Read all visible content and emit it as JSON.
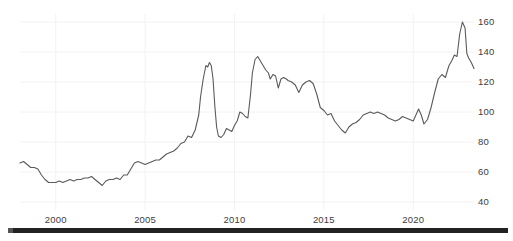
{
  "chart_data": {
    "type": "line",
    "title": "",
    "subtitle": "",
    "xlabel": "",
    "ylabel": "",
    "xlim": [
      1998.0,
      2023.4
    ],
    "ylim": [
      35,
      165
    ],
    "grid": true,
    "grid_color": "#f2f2f2",
    "legend": "none",
    "line_color": "#5a5a5a",
    "line_width": 1.1,
    "background": "#ffffff",
    "yticks": [
      40,
      60,
      80,
      100,
      120,
      140,
      160
    ],
    "ytick_labels": [
      "40",
      "60",
      "80",
      "100",
      "120",
      "140",
      "160"
    ],
    "xticks": [
      2000,
      2005,
      2010,
      2015,
      2020
    ],
    "xtick_labels": [
      "2000",
      "2005",
      "2010",
      "2015",
      "2020"
    ],
    "series": [
      {
        "name": "index",
        "x": [
          1998.0,
          1998.2,
          1998.4,
          1998.6,
          1998.8,
          1999.0,
          1999.2,
          1999.4,
          1999.6,
          1999.8,
          2000.0,
          2000.2,
          2000.4,
          2000.6,
          2000.8,
          2001.0,
          2001.2,
          2001.4,
          2001.6,
          2001.8,
          2002.0,
          2002.2,
          2002.4,
          2002.6,
          2002.8,
          2003.0,
          2003.2,
          2003.4,
          2003.6,
          2003.8,
          2004.0,
          2004.2,
          2004.4,
          2004.6,
          2004.8,
          2005.0,
          2005.2,
          2005.4,
          2005.6,
          2005.8,
          2006.0,
          2006.2,
          2006.4,
          2006.6,
          2006.8,
          2007.0,
          2007.2,
          2007.4,
          2007.6,
          2007.8,
          2008.0,
          2008.1,
          2008.25,
          2008.4,
          2008.5,
          2008.6,
          2008.7,
          2008.8,
          2008.9,
          2009.0,
          2009.1,
          2009.25,
          2009.4,
          2009.55,
          2009.7,
          2009.85,
          2010.0,
          2010.15,
          2010.3,
          2010.45,
          2010.6,
          2010.75,
          2010.9,
          2011.0,
          2011.15,
          2011.3,
          2011.45,
          2011.6,
          2011.75,
          2011.9,
          2012.0,
          2012.15,
          2012.3,
          2012.45,
          2012.6,
          2012.75,
          2012.9,
          2013.0,
          2013.2,
          2013.4,
          2013.6,
          2013.8,
          2014.0,
          2014.2,
          2014.4,
          2014.6,
          2014.8,
          2015.0,
          2015.2,
          2015.4,
          2015.6,
          2015.8,
          2016.0,
          2016.2,
          2016.4,
          2016.6,
          2016.8,
          2017.0,
          2017.2,
          2017.4,
          2017.6,
          2017.8,
          2018.0,
          2018.2,
          2018.4,
          2018.6,
          2018.8,
          2019.0,
          2019.2,
          2019.4,
          2019.6,
          2019.8,
          2020.0,
          2020.15,
          2020.3,
          2020.45,
          2020.6,
          2020.8,
          2021.0,
          2021.2,
          2021.4,
          2021.6,
          2021.8,
          2022.0,
          2022.15,
          2022.3,
          2022.45,
          2022.6,
          2022.75,
          2022.9,
          2023.0,
          2023.1,
          2023.25,
          2023.4
        ],
        "y": [
          66,
          67,
          65,
          63,
          63,
          62,
          58,
          55,
          53,
          53,
          53,
          54,
          53,
          54,
          55,
          54,
          55,
          55,
          56,
          56,
          57,
          55,
          53,
          51,
          54,
          55,
          55,
          56,
          55,
          58,
          58,
          62,
          66,
          67,
          66,
          65,
          66,
          67,
          68,
          68,
          70,
          72,
          73,
          74,
          76,
          79,
          80,
          84,
          83,
          88,
          98,
          110,
          122,
          131,
          130,
          133,
          131,
          122,
          104,
          90,
          84,
          83,
          85,
          89,
          88,
          87,
          91,
          94,
          100,
          99,
          97,
          96,
          112,
          126,
          135,
          137,
          134,
          131,
          128,
          126,
          122,
          125,
          124,
          116,
          122,
          123,
          122,
          121,
          120,
          118,
          113,
          118,
          120,
          121,
          119,
          112,
          103,
          101,
          98,
          99,
          94,
          91,
          88,
          86,
          90,
          92,
          93,
          95,
          98,
          99,
          100,
          99,
          100,
          99,
          98,
          96,
          95,
          94,
          95,
          97,
          96,
          95,
          94,
          98,
          102,
          98,
          92,
          95,
          103,
          113,
          122,
          125,
          123,
          131,
          134,
          138,
          137,
          152,
          160,
          156,
          139,
          136,
          133,
          129
        ]
      }
    ],
    "annotations": []
  },
  "axis": {
    "ytick_positions_px": [
      202,
      172,
      142,
      112,
      82,
      52,
      22
    ],
    "xtick_positions_px": [
      58,
      152,
      245,
      337,
      430
    ]
  },
  "footer": {
    "bar_present": true
  }
}
